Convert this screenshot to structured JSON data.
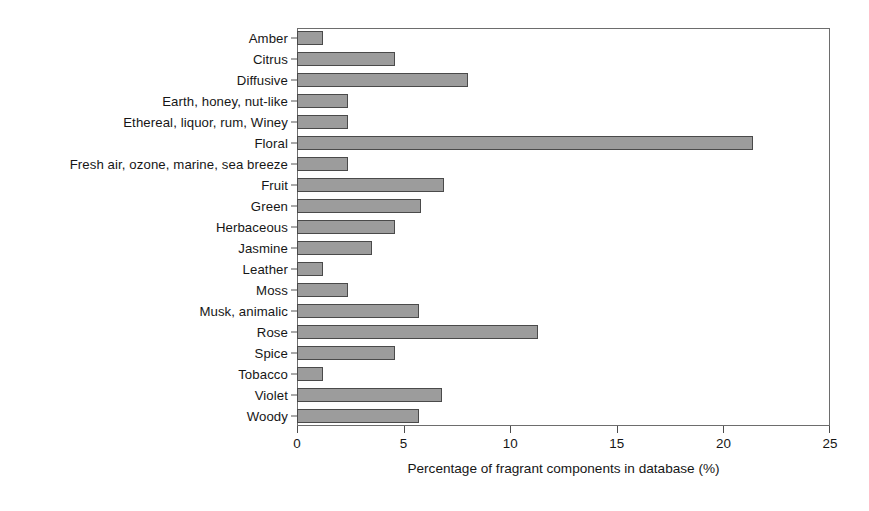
{
  "chart_data": {
    "type": "bar",
    "orientation": "horizontal",
    "title": "",
    "xlabel": "Percentage of fragrant components in database (%)",
    "ylabel": "",
    "xlim": [
      0,
      25
    ],
    "xticks": [
      0,
      5,
      10,
      15,
      20,
      25
    ],
    "grid": false,
    "legend": null,
    "bar_color": "#9c9c9c",
    "bar_edge_color": "#4a4a4a",
    "frame_color": "#6d6d6d",
    "categories": [
      "Amber",
      "Citrus",
      "Diffusive",
      "Earth, honey, nut-like",
      "Ethereal, liquor, rum, Winey",
      "Floral",
      "Fresh air, ozone, marine, sea breeze",
      "Fruit",
      "Green",
      "Herbaceous",
      "Jasmine",
      "Leather",
      "Moss",
      "Musk, animalic",
      "Rose",
      "Spice",
      "Tobacco",
      "Violet",
      "Woody"
    ],
    "values": [
      1.2,
      4.6,
      8.0,
      2.4,
      2.4,
      21.4,
      2.4,
      6.9,
      5.8,
      4.6,
      3.5,
      1.2,
      2.4,
      5.7,
      11.3,
      4.6,
      1.2,
      6.8,
      5.7
    ]
  }
}
